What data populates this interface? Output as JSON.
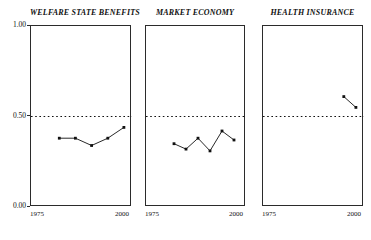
{
  "figure": {
    "width": 371,
    "height": 240,
    "background": "#ffffff",
    "ink_color": "#1a1a1a",
    "reference_line_value": "0.50"
  },
  "axes": {
    "ylim": [
      0,
      1
    ],
    "xlim": [
      1975,
      2000
    ],
    "ytick_labels": [
      "1.00",
      "0.50",
      "0.00"
    ],
    "ytick_values": [
      1.0,
      0.5,
      0.0
    ],
    "xtick_labels": [
      "1975",
      "2000"
    ],
    "xtick_values": [
      1975,
      2000
    ],
    "y_labels_shown_on": "first-panel-only",
    "grid": false,
    "reference_line": {
      "y": 0.5,
      "style": "dotted"
    }
  },
  "chart_data": [
    {
      "type": "line",
      "title": "WELFARE STATE BENEFITS",
      "xlabel": "",
      "ylabel": "",
      "xlim": [
        1975,
        2000
      ],
      "ylim": [
        0,
        1
      ],
      "x": [
        1982,
        1986,
        1990,
        1994,
        1998
      ],
      "values": [
        0.38,
        0.38,
        0.34,
        0.38,
        0.44
      ],
      "marker": "square",
      "legend": null
    },
    {
      "type": "line",
      "title": "MARKET ECONOMY",
      "xlabel": "",
      "ylabel": "",
      "xlim": [
        1975,
        2000
      ],
      "ylim": [
        0,
        1
      ],
      "x": [
        1982,
        1985,
        1988,
        1991,
        1994,
        1997
      ],
      "values": [
        0.35,
        0.32,
        0.38,
        0.31,
        0.42,
        0.37
      ],
      "marker": "square",
      "legend": null
    },
    {
      "type": "line",
      "title": "HEALTH INSURANCE",
      "xlabel": "",
      "ylabel": "",
      "xlim": [
        1975,
        2000
      ],
      "ylim": [
        0,
        1
      ],
      "x": [
        1995,
        1998
      ],
      "values": [
        0.61,
        0.55
      ],
      "marker": "square",
      "legend": null
    }
  ]
}
